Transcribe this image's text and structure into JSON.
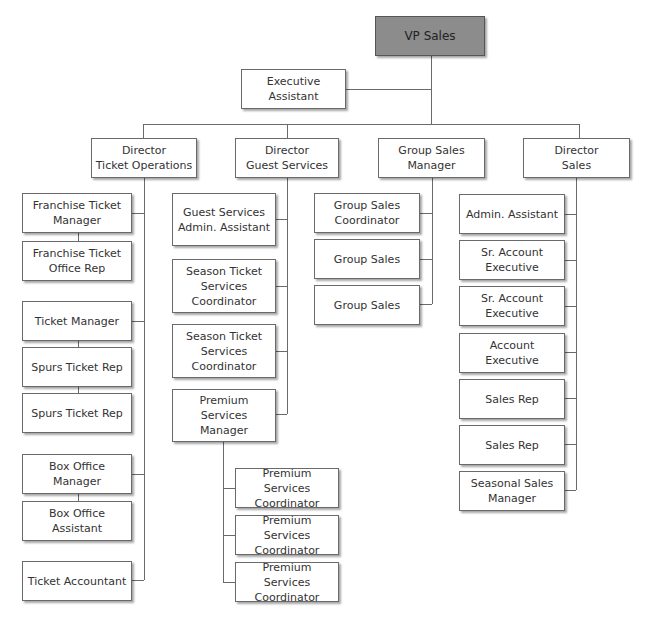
{
  "colors": {
    "vp_fill": "#8c8c8c",
    "box_fill": "#ffffff",
    "line": "#6a6a6a"
  },
  "top": {
    "vp": "VP Sales",
    "exec_assistant": "Executive Assistant"
  },
  "directors": [
    {
      "label": "Director\nTicket Operations"
    },
    {
      "label": "Director\nGuest Services"
    },
    {
      "label": "Group Sales\nManager"
    },
    {
      "label": "Director\nSales"
    }
  ],
  "ticket_ops": [
    "Franchise Ticket\nManager",
    "Franchise Ticket\nOffice Rep",
    "Ticket Manager",
    "Spurs Ticket Rep",
    "Spurs Ticket Rep",
    "Box Office Manager",
    "Box Office\nAssistant",
    "Ticket Accountant"
  ],
  "guest_services": [
    "Guest Services\nAdmin. Assistant",
    "Season Ticket\nServices\nCoordinator",
    "Season Ticket\nServices\nCoordinator",
    "Premium\nServices\nManager"
  ],
  "premium_services": [
    "Premium Services\nCoordinator",
    "Premium Services\nCoordinator",
    "Premium Services\nCoordinator"
  ],
  "group_sales": [
    "Group Sales\nCoordinator",
    "Group Sales",
    "Group Sales"
  ],
  "sales": [
    "Admin. Assistant",
    "Sr. Account\nExecutive",
    "Sr. Account\nExecutive",
    "Account Executive",
    "Sales Rep",
    "Sales Rep",
    "Seasonal Sales\nManager"
  ]
}
